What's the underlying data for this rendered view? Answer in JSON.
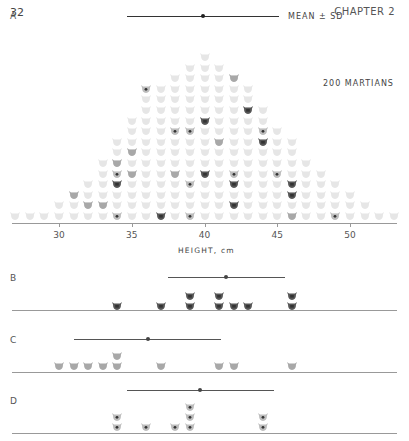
{
  "page": {
    "number": "32",
    "chapter": "CHAPTER 2"
  },
  "panel_a": {
    "label": "A",
    "legend": "MEAN ± SD",
    "population_label": "200 MARTIANS",
    "xlabel": "HEIGHT, cm",
    "ticks": [
      "30",
      "35",
      "40",
      "45",
      "50"
    ]
  },
  "panel_b": {
    "label": "B"
  },
  "panel_c": {
    "label": "C"
  },
  "panel_d": {
    "label": "D"
  },
  "colors": {
    "faint": "#e6e6e6",
    "sample_b": "#555555",
    "sample_c": "#a8a8a8",
    "sample_d": "#8a8a8a",
    "axis": "#999999"
  },
  "chart_data": [
    {
      "type": "scatter",
      "title": "A — 200 MARTIANS (population dot histogram)",
      "xlabel": "HEIGHT, cm",
      "xlim": [
        27,
        53
      ],
      "xticks": [
        30,
        35,
        40,
        45,
        50
      ],
      "population_counts": {
        "x": [
          27,
          28,
          29,
          30,
          31,
          32,
          33,
          34,
          35,
          36,
          37,
          38,
          39,
          40,
          41,
          42,
          43,
          44,
          45,
          46,
          47,
          48,
          49,
          50,
          51,
          52,
          53
        ],
        "counts": [
          1,
          1,
          1,
          2,
          3,
          4,
          6,
          8,
          10,
          12,
          13,
          14,
          15,
          16,
          15,
          14,
          13,
          11,
          9,
          8,
          6,
          5,
          4,
          3,
          2,
          1,
          1
        ]
      },
      "mean": 40,
      "sd_range": [
        34.5,
        45.5
      ],
      "legend": [
        "MEAN ± SD"
      ]
    },
    {
      "type": "scatter",
      "title": "B",
      "values": [
        34,
        37,
        39,
        39,
        41,
        41,
        42,
        43,
        46,
        46
      ],
      "mean": 41,
      "sd_range": [
        37,
        45
      ]
    },
    {
      "type": "scatter",
      "title": "C",
      "values": [
        30,
        31,
        32,
        33,
        34,
        34,
        37,
        41,
        42,
        46
      ],
      "mean": 36,
      "sd_range": [
        31,
        41
      ]
    },
    {
      "type": "scatter",
      "title": "D",
      "values": [
        34,
        34,
        36,
        38,
        39,
        39,
        39,
        44,
        44
      ],
      "mean": 39.5,
      "sd_range": [
        35,
        45
      ]
    }
  ]
}
